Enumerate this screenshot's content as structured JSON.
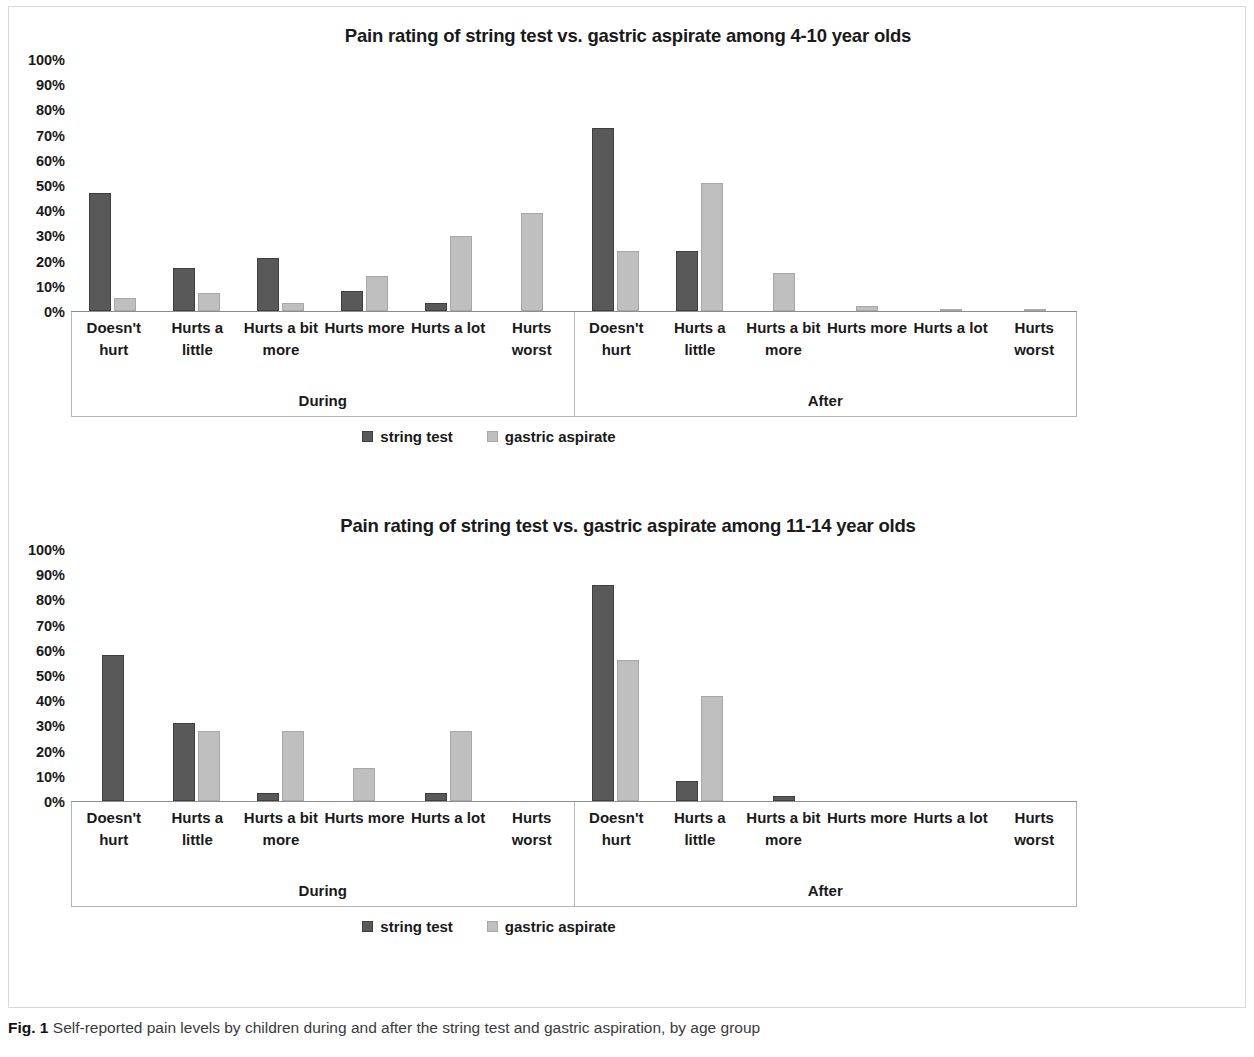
{
  "figure": {
    "caption_prefix": "Fig. 1",
    "caption_text": "Self-reported pain levels by children during and after the string test and gastric aspiration, by age group"
  },
  "colors": {
    "series_a": "#595959",
    "series_b": "#bfbfbf",
    "axis": "#8d8d8d",
    "text": "#1a1a1a"
  },
  "legend": {
    "series_a_label": "string test",
    "series_b_label": "gastric aspirate"
  },
  "axis": {
    "y_ticks": [
      "100%",
      "90%",
      "80%",
      "70%",
      "60%",
      "50%",
      "40%",
      "30%",
      "20%",
      "10%",
      "0%"
    ],
    "categories": [
      "Doesn't hurt",
      "Hurts a little",
      "Hurts a bit more",
      "Hurts more",
      "Hurts a lot",
      "Hurts worst"
    ],
    "groups": [
      "During",
      "After"
    ]
  },
  "chart_data": [
    {
      "type": "bar",
      "title": "Pain rating of string test vs. gastric aspirate among 4-10 year olds",
      "xlabel": "",
      "ylabel": "",
      "ylim": [
        0,
        100
      ],
      "grid": false,
      "legend_position": "bottom",
      "group_labels": [
        "During",
        "After"
      ],
      "categories": [
        "Doesn't hurt",
        "Hurts a little",
        "Hurts a bit more",
        "Hurts more",
        "Hurts a lot",
        "Hurts worst",
        "Doesn't hurt",
        "Hurts a little",
        "Hurts a bit more",
        "Hurts more",
        "Hurts a lot",
        "Hurts worst"
      ],
      "series": [
        {
          "name": "string test",
          "values": [
            47,
            17,
            21,
            8,
            3,
            0,
            73,
            24,
            0,
            0,
            0,
            0
          ]
        },
        {
          "name": "gastric aspirate",
          "values": [
            5,
            7,
            3,
            14,
            30,
            39,
            24,
            51,
            15,
            2,
            1,
            1
          ]
        }
      ]
    },
    {
      "type": "bar",
      "title": "Pain rating of string test vs. gastric aspirate among 11-14 year olds",
      "xlabel": "",
      "ylabel": "",
      "ylim": [
        0,
        100
      ],
      "grid": false,
      "legend_position": "bottom",
      "group_labels": [
        "During",
        "After"
      ],
      "categories": [
        "Doesn't hurt",
        "Hurts a little",
        "Hurts a bit more",
        "Hurts more",
        "Hurts a lot",
        "Hurts worst",
        "Doesn't hurt",
        "Hurts a little",
        "Hurts a bit more",
        "Hurts more",
        "Hurts a lot",
        "Hurts worst"
      ],
      "series": [
        {
          "name": "string test",
          "values": [
            58,
            31,
            3,
            0,
            3,
            0,
            86,
            8,
            2,
            0,
            0,
            0
          ]
        },
        {
          "name": "gastric aspirate",
          "values": [
            0,
            28,
            28,
            13,
            28,
            0,
            56,
            42,
            0,
            0,
            0,
            0
          ]
        }
      ]
    }
  ]
}
